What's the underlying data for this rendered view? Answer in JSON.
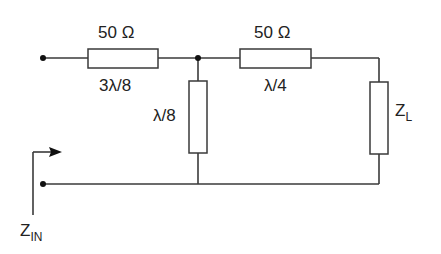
{
  "diagram": {
    "type": "transmission-line circuit",
    "series_line_1": {
      "impedance": "50 Ω",
      "length": "3λ/8"
    },
    "series_line_2": {
      "impedance": "50 Ω",
      "length": "λ/4"
    },
    "shunt_stub": {
      "length": "λ/8"
    },
    "load": {
      "label_main": "Z",
      "label_sub": "L"
    },
    "input": {
      "label_main": "Z",
      "label_sub": "IN"
    }
  },
  "colors": {
    "line": "#3a3a3a",
    "dot": "#111111",
    "text": "#222222",
    "background": "#ffffff"
  }
}
